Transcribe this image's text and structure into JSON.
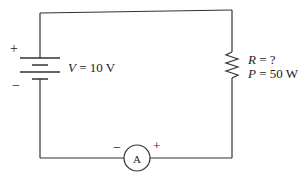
{
  "diagram": {
    "type": "circuit",
    "battery": {
      "plus_sign": "+",
      "minus_sign": "−",
      "label_var": "V",
      "label_rest": " = 10 V"
    },
    "resistor": {
      "r_var": "R",
      "r_rest": " = ?",
      "p_var": "P",
      "p_rest": " = 50 W"
    },
    "ammeter": {
      "symbol": "A",
      "minus_sign": "−",
      "plus_sign": "+"
    },
    "colors": {
      "wire": "#333333",
      "text": "#222222"
    }
  }
}
